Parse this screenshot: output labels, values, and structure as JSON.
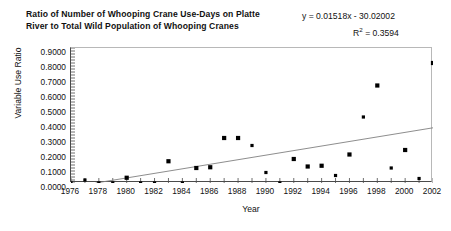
{
  "chart_data": {
    "type": "scatter",
    "title": "Ratio of Number of Whooping Crane Use-Days on Platte River to Total Wild Population of Whooping Cranes",
    "title_line1": "Ratio of Number of Whooping Crane Use-Days on Platte River to",
    "title_line2": "Total Wild Population of Whooping Cranes",
    "xlabel": "Year",
    "ylabel": "Variable Use Ratio",
    "xlim": [
      1976,
      2002
    ],
    "ylim": [
      0.0,
      0.9
    ],
    "x_tick_step": 2,
    "x_minor_tick_step": 1,
    "y_tick_step": 0.1,
    "grid": false,
    "legend": false,
    "marker": "square",
    "marker_color": "#000000",
    "trendline_color": "#808080",
    "frame_color": "#4a4a4a",
    "xticks": [
      1976,
      1978,
      1980,
      1982,
      1984,
      1986,
      1988,
      1990,
      1992,
      1994,
      1996,
      1998,
      2000,
      2002
    ],
    "xtick_labels": [
      "1976",
      "1978",
      "1980",
      "1982",
      "1984",
      "1986",
      "1988",
      "1990",
      "1992",
      "1994",
      "1996",
      "1998",
      "2000",
      "2002"
    ],
    "yticks": [
      0.0,
      0.1,
      0.2,
      0.3,
      0.4,
      0.5,
      0.6,
      0.7,
      0.8,
      0.9
    ],
    "ytick_labels": [
      "0.0000",
      "0.1000",
      "0.2000",
      "0.3000",
      "0.4000",
      "0.5000",
      "0.6000",
      "0.7000",
      "0.8000",
      "0.9000"
    ],
    "series": [
      {
        "name": "Variable Use Ratio",
        "x": [
          1976,
          1977,
          1978,
          1979,
          1980,
          1981,
          1982,
          1983,
          1984,
          1985,
          1986,
          1987,
          1988,
          1989,
          1990,
          1991,
          1992,
          1993,
          1994,
          1995,
          1996,
          1997,
          1998,
          1999,
          2000,
          2001,
          2002
        ],
        "y": [
          0.0,
          0.02,
          0.0,
          0.0,
          0.035,
          0.0,
          0.0,
          0.145,
          0.0,
          0.1,
          0.105,
          0.3,
          0.3,
          0.25,
          0.07,
          0.0,
          0.16,
          0.11,
          0.115,
          0.05,
          0.19,
          0.44,
          0.65,
          0.1,
          0.22,
          0.03,
          0.8
        ]
      }
    ],
    "trendline": {
      "equation": "y = 0.01518x - 30.02002",
      "r_squared_label": "R",
      "r_squared_exponent": "2",
      "r_squared_value": "= 0.3594",
      "r_squared_full": "R2 = 0.3594",
      "slope": 0.01518,
      "intercept": -30.02002,
      "r_squared": 0.3594,
      "x_start": 1977.77,
      "x_end": 2002,
      "y_start": 0.0,
      "y_end": 0.368
    }
  }
}
